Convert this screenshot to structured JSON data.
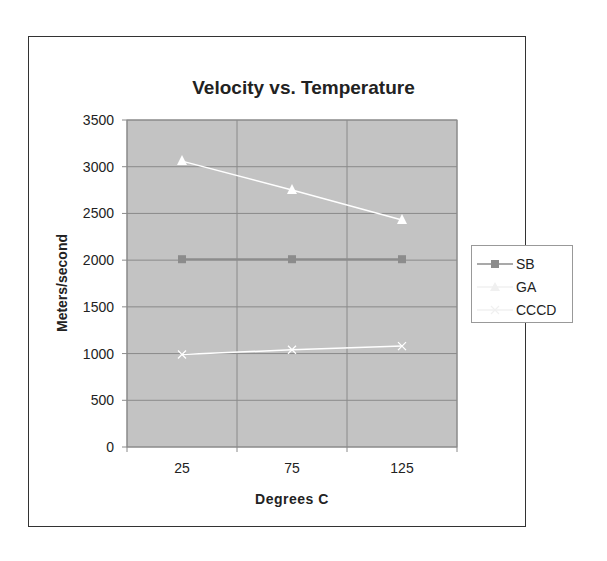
{
  "chart_data": {
    "type": "line",
    "title": "Velocity vs. Temperature",
    "xlabel": "Degrees C",
    "ylabel": "Meters/second",
    "categories": [
      "25",
      "75",
      "125"
    ],
    "ylim": [
      0,
      3500
    ],
    "yticks": [
      "0",
      "500",
      "1000",
      "1500",
      "2000",
      "2500",
      "3000",
      "3500"
    ],
    "grid": true,
    "legend_position": "right",
    "series": [
      {
        "name": "SB",
        "values": [
          2010,
          2010,
          2010
        ],
        "marker": "square",
        "color": "#8c8c8c"
      },
      {
        "name": "GA",
        "values": [
          null,
          null,
          null
        ],
        "marker": "triangle",
        "color": "#f2f2f2"
      },
      {
        "name": "CCCD",
        "values": [
          990,
          1040,
          1080
        ],
        "marker": "x",
        "color": "#ffffff"
      }
    ],
    "extra_series_plotted": [
      {
        "name": "GA (triangles)",
        "values": [
          3060,
          2750,
          2430
        ],
        "marker": "triangle",
        "color": "#ffffff"
      }
    ],
    "plot_background": "#c0c0c0",
    "gridline_color": "#8a8a8a"
  },
  "legend": {
    "items": [
      {
        "label": "SB"
      },
      {
        "label": "GA"
      },
      {
        "label": "CCCD"
      }
    ]
  }
}
